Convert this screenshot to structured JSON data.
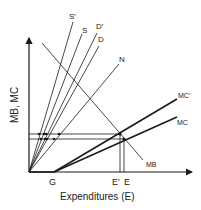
{
  "diagram": {
    "y_axis_label": "MB, MC",
    "x_axis_label": "Expenditures (E)",
    "x_ticks": {
      "G": "G",
      "E_prime": "E′",
      "E": "E"
    },
    "ray_labels": {
      "S_prime": "S′",
      "S": "S",
      "D_prime": "D′",
      "D": "D",
      "N": "N"
    },
    "curve_labels": {
      "MC_prime": "MC′",
      "MC": "MC",
      "MB": "MB"
    },
    "colors": {
      "line": "#1a1a1a",
      "background": "#ffffff"
    }
  }
}
